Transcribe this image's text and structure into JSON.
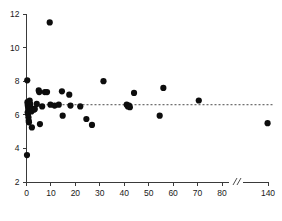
{
  "figure": {
    "width": 282,
    "height": 221,
    "background": "#ffffff"
  },
  "chart_data": {
    "type": "scatter",
    "title": "",
    "xlabel": "",
    "ylabel": "",
    "xlim": [
      0,
      140
    ],
    "ylim": [
      2,
      12
    ],
    "grid": false,
    "legend": false,
    "axis_break": {
      "present": true,
      "symbol": "//",
      "between": [
        80,
        140
      ]
    },
    "xticks": [
      0,
      10,
      20,
      30,
      40,
      50,
      60,
      70,
      80,
      140
    ],
    "xtick_labels": [
      "0",
      "10",
      "20",
      "30",
      "40",
      "50",
      "60",
      "70",
      "80",
      "140"
    ],
    "yticks": [
      2,
      4,
      6,
      8,
      10,
      12
    ],
    "ytick_labels": [
      "2",
      "4",
      "6",
      "8",
      "10",
      "12"
    ],
    "reference_line": {
      "orientation": "horizontal",
      "y": 6.6,
      "style": "dashed",
      "color": "#4a4a4a"
    },
    "marker": {
      "shape": "circle",
      "color": "#0d0d0d",
      "size": 3.1
    },
    "points": [
      {
        "x": 0.2,
        "y": 3.6
      },
      {
        "x": 0.3,
        "y": 8.05
      },
      {
        "x": 0.4,
        "y": 6.75
      },
      {
        "x": 0.5,
        "y": 6.6
      },
      {
        "x": 0.6,
        "y": 6.5
      },
      {
        "x": 0.7,
        "y": 6.35
      },
      {
        "x": 0.5,
        "y": 6.15
      },
      {
        "x": 0.6,
        "y": 6.05
      },
      {
        "x": 0.8,
        "y": 5.85
      },
      {
        "x": 0.9,
        "y": 5.65
      },
      {
        "x": 1.0,
        "y": 5.55
      },
      {
        "x": 1.3,
        "y": 6.85
      },
      {
        "x": 1.5,
        "y": 6.65
      },
      {
        "x": 1.6,
        "y": 6.45
      },
      {
        "x": 1.8,
        "y": 6.3
      },
      {
        "x": 2.0,
        "y": 6.2
      },
      {
        "x": 2.2,
        "y": 5.25
      },
      {
        "x": 2.6,
        "y": 6.35
      },
      {
        "x": 3.0,
        "y": 6.3
      },
      {
        "x": 3.4,
        "y": 6.35
      },
      {
        "x": 4.2,
        "y": 6.65
      },
      {
        "x": 5.0,
        "y": 7.45
      },
      {
        "x": 5.2,
        "y": 7.35
      },
      {
        "x": 5.5,
        "y": 5.45
      },
      {
        "x": 6.4,
        "y": 6.5
      },
      {
        "x": 7.5,
        "y": 7.35
      },
      {
        "x": 8.4,
        "y": 7.35
      },
      {
        "x": 9.5,
        "y": 11.5
      },
      {
        "x": 9.8,
        "y": 6.6
      },
      {
        "x": 11.5,
        "y": 6.55
      },
      {
        "x": 13.2,
        "y": 6.6
      },
      {
        "x": 14.5,
        "y": 7.4
      },
      {
        "x": 14.8,
        "y": 5.95
      },
      {
        "x": 17.5,
        "y": 7.2
      },
      {
        "x": 18.0,
        "y": 6.55
      },
      {
        "x": 22.0,
        "y": 6.5
      },
      {
        "x": 24.5,
        "y": 5.75
      },
      {
        "x": 26.8,
        "y": 5.4
      },
      {
        "x": 31.5,
        "y": 8.0
      },
      {
        "x": 41.0,
        "y": 6.6
      },
      {
        "x": 41.5,
        "y": 6.5
      },
      {
        "x": 42.0,
        "y": 6.55
      },
      {
        "x": 42.3,
        "y": 6.45
      },
      {
        "x": 44.0,
        "y": 7.3
      },
      {
        "x": 54.5,
        "y": 5.95
      },
      {
        "x": 56.0,
        "y": 7.6
      },
      {
        "x": 70.5,
        "y": 6.85
      },
      {
        "x": 139.0,
        "y": 5.5
      }
    ]
  }
}
